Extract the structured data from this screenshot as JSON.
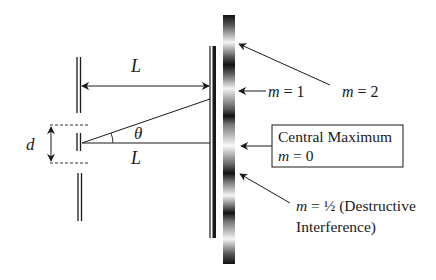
{
  "figure": {
    "colors": {
      "ink": "#1a1a1a",
      "background": "#ffffff",
      "fringe_dark": "#111111",
      "fringe_light": "#f4f4f4"
    }
  },
  "labels": {
    "top_distance": "L",
    "bottom_distance": "L",
    "angle": "θ",
    "slit_separation": "d",
    "m1": "m = 1",
    "m2": "m = 2",
    "central_line1": "Central Maximum",
    "central_line2": "m = 0",
    "destructive_line1_prefix": "m = ",
    "destructive_half": "½",
    "destructive_line1_suffix": " (Destructive",
    "destructive_line2": "Interference)"
  },
  "fringes": {
    "dark_y": [
      18,
      57,
      115,
      173,
      213,
      262
    ],
    "bright_y": [
      42,
      88,
      146,
      195,
      240
    ]
  }
}
